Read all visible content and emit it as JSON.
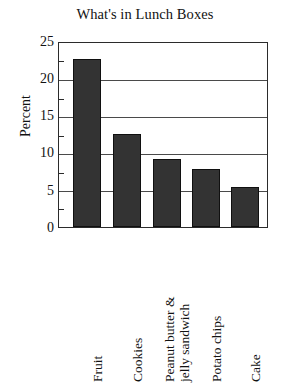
{
  "chart_data": {
    "type": "bar",
    "title": "What's in Lunch Boxes",
    "xlabel": "",
    "ylabel": "Percent",
    "categories": [
      "Fruit",
      "Cookies",
      "Peanut butter & jelly sandwich",
      "Potato chips",
      "Cake"
    ],
    "category_lines": [
      [
        "Fruit"
      ],
      [
        "Cookies"
      ],
      [
        "Peanut butter &",
        "jelly sandwich"
      ],
      [
        "Potato chips"
      ],
      [
        "Cake"
      ]
    ],
    "values": [
      22.8,
      12.6,
      9.3,
      7.9,
      5.4
    ],
    "ylim": [
      0,
      25
    ],
    "ytick_labels": [
      "25",
      "20",
      "15",
      "10",
      "5",
      "0"
    ],
    "ytick_values": [
      25,
      20,
      15,
      10,
      5,
      0
    ],
    "gridlines": [
      20,
      15,
      10,
      5
    ],
    "grid": true,
    "legend": "none",
    "bar_color": "#333333",
    "frame_color": "#2b2b2b",
    "background": "#ffffff"
  },
  "labels": {
    "title": "What's in Lunch Boxes",
    "ylabel": "Percent",
    "y0": "0",
    "y5": "5",
    "y10": "10",
    "y15": "15",
    "y20": "20",
    "y25": "25",
    "cat0": "Fruit",
    "cat1": "Cookies",
    "cat2_line1": "Peanut butter &",
    "cat2_line2": "jelly sandwich",
    "cat3": "Potato chips",
    "cat4": "Cake"
  }
}
